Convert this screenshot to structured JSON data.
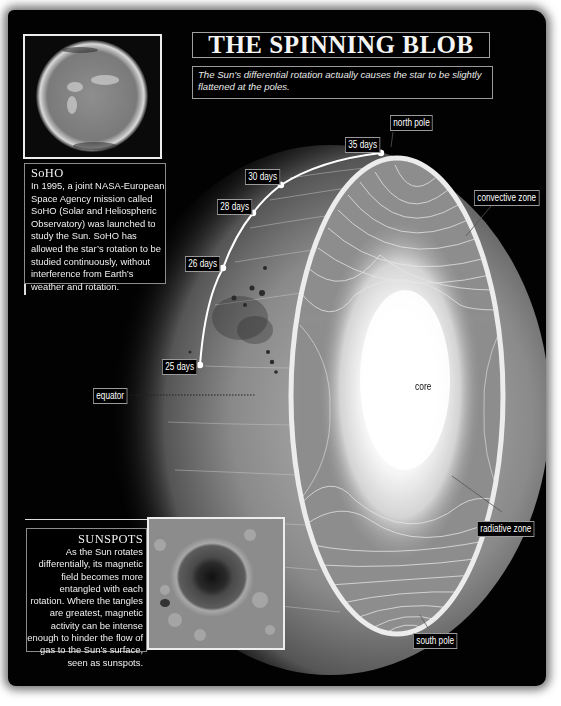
{
  "title": "THE SPINNING BLOB",
  "subtitle": "The Sun’s differential rotation actually causes the star to be slightly flattened at the poles.",
  "soho": {
    "heading": "SoHO",
    "body": "In 1995, a joint NASA-European Space Agency mission called SoHO (Solar and Heliospheric Observatory) was launched to study the Sun. SoHO has allowed the star’s rotation to be studied continuously, without interference from Earth’s weather and rotation.",
    "image_alt": "SoHO image of the Sun"
  },
  "sunspots": {
    "heading": "SUNSPOTS",
    "body": "As the Sun rotates differentially, its magnetic field becomes more entangled with each rotation. Where the tangles are greatest, magnetic activity can be intense enough to hinder the flow of gas to the Sun’s surface, seen as sunspots.",
    "image_alt": "Close-up of a sunspot"
  },
  "rotation_periods": [
    {
      "label": "35 days",
      "latitude": "pole"
    },
    {
      "label": "30 days"
    },
    {
      "label": "28 days"
    },
    {
      "label": "26 days"
    },
    {
      "label": "25 days",
      "latitude": "equator"
    }
  ],
  "labels": {
    "north_pole": "north pole",
    "south_pole": "south pole",
    "equator": "equator",
    "convective_zone": "convective zone",
    "radiative_zone": "radiative zone",
    "core": "core"
  },
  "colors": {
    "background": "#020202",
    "page": "#ffffff",
    "text": "#f0f0f0",
    "box_border": "#9a9a9a",
    "rim": "#e8e8e8"
  }
}
